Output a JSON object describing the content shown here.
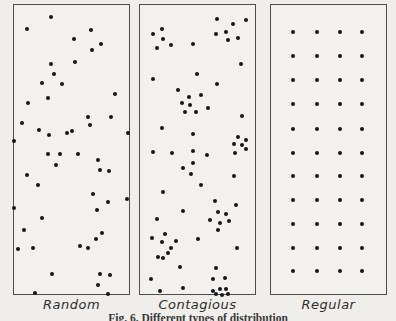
{
  "figure": {
    "caption": "Fig. 6. Different types of distribution",
    "panels": [
      {
        "label": "Random",
        "box": {
          "x": 13,
          "y": 4,
          "w": 117,
          "h": 291
        },
        "dots": [
          [
            50,
            16
          ],
          [
            26,
            28
          ],
          [
            90,
            29
          ],
          [
            73,
            38
          ],
          [
            100,
            43
          ],
          [
            91,
            49
          ],
          [
            74,
            61
          ],
          [
            50,
            63
          ],
          [
            53,
            73
          ],
          [
            41,
            82
          ],
          [
            61,
            83
          ],
          [
            47,
            97
          ],
          [
            114,
            93
          ],
          [
            27,
            102
          ],
          [
            21,
            122
          ],
          [
            87,
            116
          ],
          [
            110,
            116
          ],
          [
            89,
            124
          ],
          [
            38,
            129
          ],
          [
            48,
            134
          ],
          [
            66,
            132
          ],
          [
            71,
            130
          ],
          [
            127,
            132
          ],
          [
            13,
            140
          ],
          [
            47,
            153
          ],
          [
            59,
            153
          ],
          [
            77,
            153
          ],
          [
            97,
            159
          ],
          [
            55,
            164
          ],
          [
            99,
            169
          ],
          [
            108,
            170
          ],
          [
            26,
            174
          ],
          [
            37,
            184
          ],
          [
            92,
            193
          ],
          [
            126,
            198
          ],
          [
            107,
            201
          ],
          [
            13,
            207
          ],
          [
            96,
            209
          ],
          [
            41,
            217
          ],
          [
            23,
            229
          ],
          [
            101,
            232
          ],
          [
            95,
            238
          ],
          [
            79,
            245
          ],
          [
            87,
            247
          ],
          [
            17,
            248
          ],
          [
            32,
            247
          ],
          [
            51,
            273
          ],
          [
            99,
            273
          ],
          [
            109,
            274
          ],
          [
            97,
            284
          ],
          [
            34,
            292
          ],
          [
            107,
            293
          ]
        ]
      },
      {
        "label": "Contagious",
        "box": {
          "x": 139,
          "y": 4,
          "w": 117,
          "h": 291
        },
        "dots": [
          [
            216,
            18
          ],
          [
            232,
            23
          ],
          [
            245,
            19
          ],
          [
            161,
            28
          ],
          [
            152,
            33
          ],
          [
            162,
            38
          ],
          [
            215,
            33
          ],
          [
            225,
            31
          ],
          [
            227,
            39
          ],
          [
            237,
            37
          ],
          [
            156,
            47
          ],
          [
            170,
            44
          ],
          [
            192,
            43
          ],
          [
            240,
            63
          ],
          [
            196,
            73
          ],
          [
            152,
            78
          ],
          [
            216,
            83
          ],
          [
            177,
            89
          ],
          [
            188,
            96
          ],
          [
            200,
            94
          ],
          [
            181,
            102
          ],
          [
            189,
            104
          ],
          [
            184,
            111
          ],
          [
            195,
            111
          ],
          [
            207,
            107
          ],
          [
            241,
            115
          ],
          [
            161,
            127
          ],
          [
            192,
            133
          ],
          [
            237,
            136
          ],
          [
            245,
            139
          ],
          [
            233,
            143
          ],
          [
            241,
            144
          ],
          [
            245,
            148
          ],
          [
            152,
            151
          ],
          [
            171,
            152
          ],
          [
            192,
            150
          ],
          [
            206,
            154
          ],
          [
            234,
            152
          ],
          [
            192,
            162
          ],
          [
            182,
            167
          ],
          [
            190,
            173
          ],
          [
            233,
            175
          ],
          [
            200,
            184
          ],
          [
            162,
            191
          ],
          [
            214,
            200
          ],
          [
            235,
            204
          ],
          [
            182,
            210
          ],
          [
            217,
            211
          ],
          [
            225,
            213
          ],
          [
            156,
            218
          ],
          [
            209,
            219
          ],
          [
            228,
            220
          ],
          [
            219,
            222
          ],
          [
            217,
            229
          ],
          [
            164,
            233
          ],
          [
            151,
            237
          ],
          [
            161,
            241
          ],
          [
            175,
            240
          ],
          [
            197,
            238
          ],
          [
            170,
            247
          ],
          [
            167,
            252
          ],
          [
            236,
            247
          ],
          [
            157,
            256
          ],
          [
            162,
            257
          ],
          [
            179,
            266
          ],
          [
            215,
            267
          ],
          [
            150,
            278
          ],
          [
            212,
            278
          ],
          [
            224,
            277
          ],
          [
            182,
            287
          ],
          [
            159,
            290
          ],
          [
            219,
            288
          ],
          [
            225,
            288
          ],
          [
            212,
            290
          ],
          [
            215,
            293
          ],
          [
            221,
            294
          ],
          [
            227,
            293
          ]
        ]
      },
      {
        "label": "Regular",
        "box": {
          "x": 270,
          "y": 4,
          "w": 117,
          "h": 291
        },
        "dots": [
          [
            292,
            31
          ],
          [
            316,
            31
          ],
          [
            339,
            31
          ],
          [
            361,
            31
          ],
          [
            292,
            55
          ],
          [
            316,
            55
          ],
          [
            339,
            55
          ],
          [
            361,
            55
          ],
          [
            292,
            79
          ],
          [
            316,
            79
          ],
          [
            339,
            79
          ],
          [
            361,
            79
          ],
          [
            292,
            103
          ],
          [
            316,
            103
          ],
          [
            339,
            103
          ],
          [
            361,
            103
          ],
          [
            292,
            128
          ],
          [
            316,
            128
          ],
          [
            339,
            128
          ],
          [
            361,
            128
          ],
          [
            292,
            152
          ],
          [
            316,
            152
          ],
          [
            339,
            152
          ],
          [
            361,
            152
          ],
          [
            292,
            175
          ],
          [
            316,
            175
          ],
          [
            339,
            175
          ],
          [
            361,
            175
          ],
          [
            292,
            199
          ],
          [
            316,
            199
          ],
          [
            339,
            199
          ],
          [
            361,
            199
          ],
          [
            292,
            223
          ],
          [
            316,
            223
          ],
          [
            339,
            223
          ],
          [
            361,
            223
          ],
          [
            292,
            247
          ],
          [
            316,
            247
          ],
          [
            339,
            247
          ],
          [
            361,
            247
          ],
          [
            292,
            270
          ],
          [
            316,
            270
          ],
          [
            339,
            270
          ],
          [
            361,
            270
          ]
        ]
      }
    ]
  },
  "colors": {
    "paper": "#f0eeea",
    "panel_fill": "#f3f1ed",
    "border": "#4d4d4d",
    "ink": "#161616",
    "label_text": "#2d2d2d",
    "caption_text": "#3a3a3a"
  },
  "chart_data": [
    {
      "type": "scatter",
      "title": "Random",
      "points_ref": "figure.panels.0.dots",
      "axes": "none",
      "note": "randomly scattered points in bordered rectangle"
    },
    {
      "type": "scatter",
      "title": "Contagious",
      "points_ref": "figure.panels.1.dots",
      "axes": "none",
      "note": "clumped/clustered points in bordered rectangle"
    },
    {
      "type": "scatter",
      "title": "Regular",
      "points_ref": "figure.panels.2.dots",
      "axes": "none",
      "note": "uniform 4x11 grid of points in bordered rectangle"
    }
  ]
}
